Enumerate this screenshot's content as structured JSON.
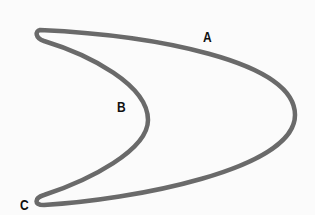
{
  "diagram": {
    "type": "closed-curve-boomerang",
    "stroke_color": "#6a6a6a",
    "background_color": "#fbfbfb",
    "labels": {
      "a": "A",
      "b": "B",
      "c": "C"
    }
  }
}
